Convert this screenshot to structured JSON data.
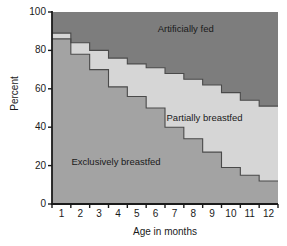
{
  "chart_data": {
    "type": "area",
    "title": "",
    "subtitle": "",
    "xlabel": "Age in months",
    "ylabel": "Percent",
    "xlim": [
      0.5,
      12.5
    ],
    "ylim": [
      0,
      100
    ],
    "grid": false,
    "legend_position": "inside-annotations",
    "categories": [
      "1",
      "2",
      "3",
      "4",
      "5",
      "6",
      "7",
      "8",
      "9",
      "10",
      "11",
      "12"
    ],
    "x": [
      1,
      2,
      3,
      4,
      5,
      6,
      7,
      8,
      9,
      10,
      11,
      12
    ],
    "x_tick_labels": [
      "1",
      "2",
      "3",
      "4",
      "5",
      "6",
      "7",
      "8",
      "9",
      "10",
      "11",
      "12"
    ],
    "y_tick_labels": [
      "0",
      "20",
      "40",
      "60",
      "80",
      "100"
    ],
    "y_ticks": [
      0,
      20,
      40,
      60,
      80,
      100
    ],
    "stacked": true,
    "step_style": "post",
    "series": [
      {
        "name": "Exclusively breastfed",
        "color": "#a3a3a3",
        "values": [
          86,
          78,
          70,
          61,
          56,
          50,
          40,
          34,
          27,
          19,
          15,
          12
        ]
      },
      {
        "name": "Partially breastfed",
        "color": "#d6d6d6",
        "values": [
          3,
          6,
          10,
          15,
          17,
          21,
          28,
          31,
          35,
          39,
          39,
          39
        ],
        "cumulative_top": [
          89,
          84,
          80,
          76,
          73,
          71,
          68,
          65,
          62,
          58,
          54,
          51
        ]
      },
      {
        "name": "Artificially fed",
        "color": "#7d7d7d",
        "values": [
          11,
          16,
          20,
          24,
          27,
          29,
          32,
          35,
          38,
          42,
          46,
          49
        ],
        "cumulative_top": [
          100,
          100,
          100,
          100,
          100,
          100,
          100,
          100,
          100,
          100,
          100,
          100
        ]
      }
    ],
    "annotations": [
      {
        "text": "Artificially fed",
        "x": 7.6,
        "y": 91
      },
      {
        "text": "Partially breastfed",
        "x": 8.6,
        "y": 45
      },
      {
        "text": "Exclusively breastfed",
        "x": 3.9,
        "y": 22
      }
    ]
  },
  "axes": {
    "y_label": "Percent",
    "x_label": "Age in months",
    "y_ticks": [
      "100",
      "80",
      "60",
      "40",
      "20",
      "0"
    ],
    "x_ticks": [
      "1",
      "2",
      "3",
      "4",
      "5",
      "6",
      "7",
      "8",
      "9",
      "10",
      "11",
      "12"
    ]
  },
  "labels": {
    "artificially_fed": "Artificially fed",
    "partially_breastfed": "Partially breastfed",
    "exclusively_breastfed": "Exclusively breastfed"
  },
  "colors": {
    "artificially_fed": "#7d7d7d",
    "partially_breastfed": "#d6d6d6",
    "exclusively_breastfed": "#a3a3a3",
    "axis": "#1a1a1a",
    "outline": "#4a4a4a",
    "background": "#ffffff"
  }
}
